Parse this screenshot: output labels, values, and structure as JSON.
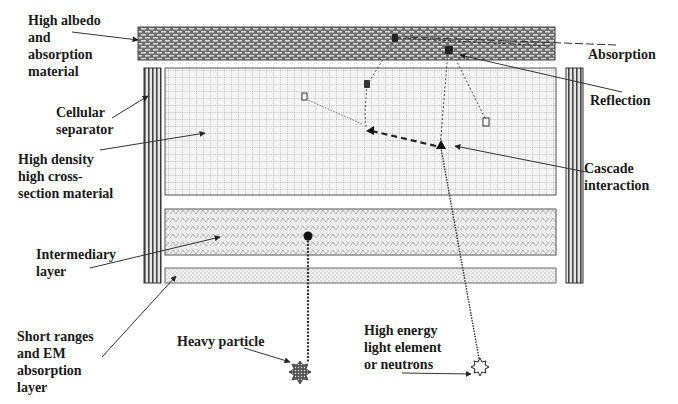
{
  "labels": {
    "high_albedo": "High albedo\nand\nabsorption\nmaterial",
    "cellular_separator": "Cellular\nseparator",
    "high_density": "High density\nhigh cross-\nsection material",
    "intermediary": "Intermediary\nlayer",
    "short_ranges": "Short ranges\nand EM\nabsorption\nlayer",
    "heavy_particle": "Heavy particle",
    "high_energy": "High energy\nlight element\nor neutrons",
    "absorption": "Absorption",
    "reflection": "Reflection",
    "cascade": "Cascade\ninteraction"
  },
  "layers": [
    {
      "id": "absorption-layer",
      "name": "High albedo and absorption material",
      "pattern": "brick"
    },
    {
      "id": "separator-left",
      "name": "Cellular separator",
      "pattern": "vertical-lines"
    },
    {
      "id": "separator-right",
      "name": "Cellular separator",
      "pattern": "vertical-lines"
    },
    {
      "id": "dense-layer",
      "name": "High density high cross-section material",
      "pattern": "grid"
    },
    {
      "id": "intermediary-layer",
      "name": "Intermediary layer",
      "pattern": "weave"
    },
    {
      "id": "short-range-layer",
      "name": "Short ranges and EM absorption layer",
      "pattern": "dots"
    }
  ],
  "colors": {
    "ink": "#2a2a2a",
    "brick_fill": "#8a8a8a",
    "grid_line": "#9a9a9a",
    "hatch": "#b0b0b0"
  }
}
